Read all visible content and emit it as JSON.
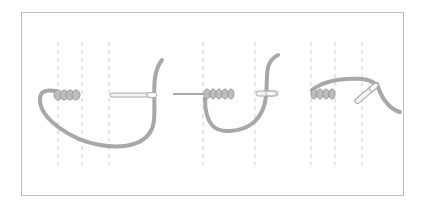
{
  "diagram": {
    "colors": {
      "background": "#ffffff",
      "frame": "#bdbdbd",
      "guide_lines": "#cfcfcf",
      "thread": "#a8a8a8",
      "needle_fill": "#f2f2f2",
      "needle_stroke": "#a8a8a8"
    },
    "steps": [
      {
        "id": 1,
        "label": "Step 1",
        "guides_x": [
          58,
          82,
          109
        ],
        "coil_wraps": 4,
        "needle_direction": "right"
      },
      {
        "id": 2,
        "label": "Step 2",
        "guides_x": [
          203,
          255
        ],
        "coil_wraps": 5,
        "needle_direction": "left-through"
      },
      {
        "id": 3,
        "label": "Step 3",
        "guides_x": [
          311,
          335,
          362
        ],
        "coil_wraps": 5,
        "needle_direction": "up-right"
      }
    ]
  }
}
